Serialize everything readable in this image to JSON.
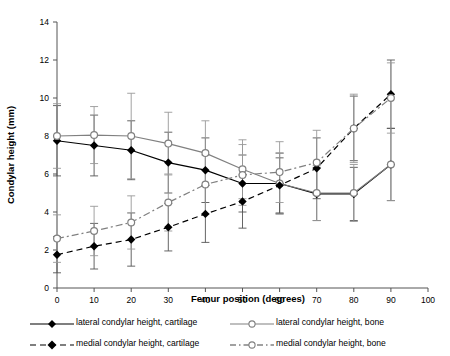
{
  "chart_data": {
    "type": "line",
    "title": "",
    "xlabel": "Femur position (degrees)",
    "ylabel": "Condylar height (mm)",
    "xlim": [
      0,
      100
    ],
    "ylim": [
      0,
      14
    ],
    "xticks": [
      0,
      10,
      20,
      30,
      40,
      50,
      60,
      70,
      80,
      90,
      100
    ],
    "yticks": [
      0,
      2,
      4,
      6,
      8,
      10,
      12,
      14
    ],
    "grid": false,
    "legend_position": "below",
    "error_bars": "symmetric standard deviation",
    "x": [
      0,
      10,
      20,
      30,
      40,
      50,
      60,
      70,
      80,
      90
    ],
    "series": [
      {
        "name": "lateral condylar height, cartilage",
        "marker": "filled-diamond",
        "line": "solid",
        "color": "#000000",
        "values": [
          7.75,
          7.5,
          7.25,
          6.6,
          6.2,
          5.5,
          5.5,
          4.95,
          4.95,
          6.5
        ],
        "errors": [
          1.85,
          1.6,
          1.55,
          1.6,
          1.7,
          1.5,
          1.6,
          1.4,
          1.4,
          1.9
        ]
      },
      {
        "name": "lateral condylar height, bone",
        "marker": "open-circle",
        "line": "solid",
        "color": "#808080",
        "values": [
          8.0,
          8.05,
          8.0,
          7.6,
          7.1,
          6.25,
          5.5,
          5.0,
          5.0,
          6.5
        ],
        "errors": [
          1.7,
          1.5,
          2.25,
          1.65,
          1.7,
          1.55,
          1.6,
          1.45,
          1.5,
          1.9
        ]
      },
      {
        "name": "medial condylar height, cartilage",
        "marker": "filled-diamond",
        "line": "dashed",
        "color": "#000000",
        "values": [
          1.75,
          2.2,
          2.55,
          3.2,
          3.9,
          4.55,
          5.4,
          6.3,
          8.4,
          10.2
        ],
        "errors": [
          0.95,
          1.2,
          1.4,
          1.25,
          1.5,
          1.4,
          1.45,
          1.6,
          1.7,
          1.8
        ]
      },
      {
        "name": "medial condylar height, bone",
        "marker": "open-circle",
        "line": "dash-dot",
        "color": "#808080",
        "values": [
          2.6,
          3.0,
          3.45,
          4.5,
          5.45,
          5.95,
          6.1,
          6.6,
          8.4,
          10.0
        ],
        "errors": [
          1.25,
          1.3,
          1.4,
          1.5,
          1.55,
          1.6,
          1.6,
          1.7,
          1.8,
          1.85
        ]
      }
    ]
  },
  "legend": {
    "entries": [
      {
        "label": "lateral condylar height, cartilage"
      },
      {
        "label": "lateral condylar height, bone"
      },
      {
        "label": "medial condylar height, cartilage"
      },
      {
        "label": "medial condylar height, bone"
      }
    ]
  },
  "colors": {
    "cartilage": "#000000",
    "bone": "#808080",
    "axis": "#000000"
  }
}
